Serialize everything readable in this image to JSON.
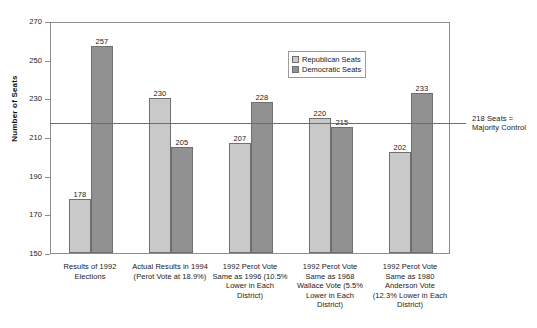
{
  "chart_data": {
    "type": "bar",
    "title": "",
    "xlabel": "",
    "ylabel": "Number of Seats",
    "ylim": [
      150,
      270
    ],
    "ytick_step": 20,
    "yticks": [
      270,
      250,
      230,
      210,
      190,
      170,
      150
    ],
    "grid": false,
    "legend_position": "inside-top-center",
    "categories": [
      "Results of 1992\nElections",
      "Actual Results in 1994\n(Perot Vote at 18.9%)",
      "1992 Perot Vote\nSame as 1996 (10.5%\nLower in Each\nDistrict)",
      "1992 Perot Vote\nSame as 1968\nWallace Vote (5.5%\nLower in Each\nDistrict)",
      "1992 Perot Vote\nSame as 1980\nAnderson Vote\n(12.3% Lower in Each\nDistrict)"
    ],
    "series": [
      {
        "name": "Republican Seats",
        "color": "#c9c9c9",
        "values": [
          178,
          230,
          207,
          220,
          202
        ]
      },
      {
        "name": "Democratic Seats",
        "color": "#919191",
        "values": [
          257,
          205,
          228,
          215,
          233
        ]
      }
    ],
    "annotations": [
      {
        "name": "majority-threshold",
        "value": 218,
        "text": "218 Seats =\nMajority Control"
      }
    ]
  },
  "legend": {
    "entries": [
      {
        "label": "Republican Seats"
      },
      {
        "label": "Democratic Seats"
      }
    ]
  }
}
